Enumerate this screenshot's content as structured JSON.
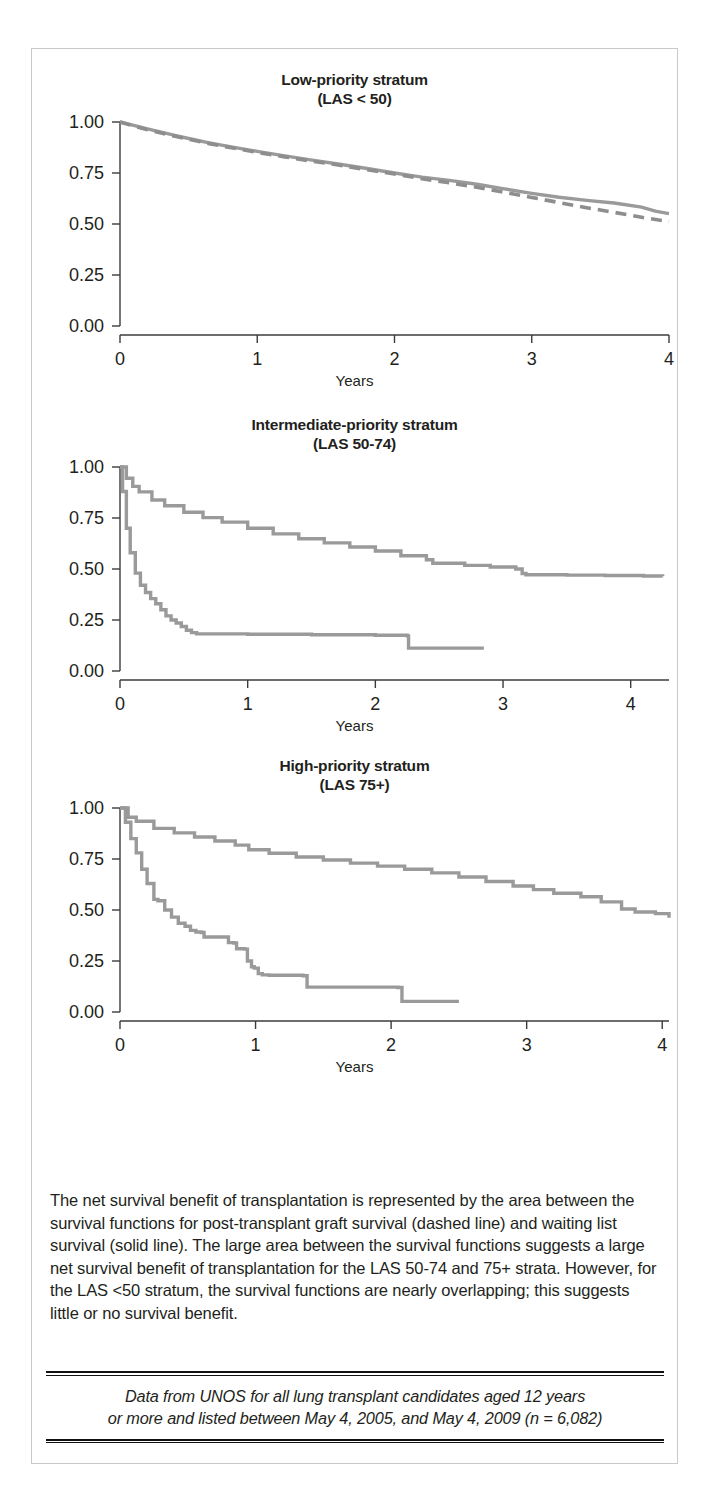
{
  "figure": {
    "border_color": "#c9c9c9",
    "background": "#ffffff"
  },
  "panels": [
    {
      "title": "Low-priority stratum",
      "subtitle": "(LAS < 50)",
      "xlabel": "Years"
    },
    {
      "title": "Intermediate-priority stratum",
      "subtitle": "(LAS 50-74)",
      "xlabel": "Years"
    },
    {
      "title": "High-priority stratum",
      "subtitle": "(LAS 75+)",
      "xlabel": "Years"
    }
  ],
  "caption": {
    "text": "The net survival benefit of transplantation is represented by the area between the survival functions for post-transplant graft survival (dashed line) and waiting list survival (solid line). The large area between the survival functions suggests a large net survival benefit of transplantation for the LAS 50-74 and 75+ strata. However, for the LAS <50 stratum, the survival functions are nearly overlapping; this suggests little or no survival benefit."
  },
  "source_note": {
    "line1": "Data from UNOS for all lung transplant candidates aged 12 years",
    "line2": "or more and listed between May 4, 2005, and May 4, 2009 (n = 6,082)"
  },
  "chart_data": [
    {
      "type": "line",
      "title": "Low-priority stratum",
      "subtitle": "(LAS < 50)",
      "xlabel": "Years",
      "ylabel": "",
      "xlim": [
        0,
        4.0
      ],
      "xticks": [
        0,
        1,
        2,
        3,
        4
      ],
      "xtick_labels": [
        "0",
        "1",
        "2",
        "3",
        "4"
      ],
      "ylim": [
        0,
        1.0
      ],
      "yticks": [
        0.0,
        0.25,
        0.5,
        0.75,
        1.0
      ],
      "ytick_labels": [
        "0.00",
        "0.25",
        "0.50",
        "0.75",
        "1.00"
      ],
      "grid": false,
      "legend": "none",
      "colors": {
        "solid": "#9a9a9a",
        "dashed": "#8e8e8e"
      },
      "series": [
        {
          "name": "Waiting list survival (solid line)",
          "style": "solid",
          "x": [
            0.0,
            0.1,
            0.2,
            0.3,
            0.4,
            0.5,
            0.65,
            0.8,
            1.0,
            1.2,
            1.4,
            1.6,
            1.8,
            2.0,
            2.2,
            2.4,
            2.6,
            2.8,
            3.0,
            3.2,
            3.4,
            3.6,
            3.8,
            3.9,
            4.0
          ],
          "y": [
            1.0,
            0.983,
            0.966,
            0.95,
            0.934,
            0.919,
            0.898,
            0.879,
            0.856,
            0.834,
            0.813,
            0.793,
            0.772,
            0.75,
            0.73,
            0.714,
            0.695,
            0.672,
            0.65,
            0.631,
            0.616,
            0.603,
            0.583,
            0.563,
            0.551
          ]
        },
        {
          "name": "Post-transplant graft survival (dashed line)",
          "style": "dashed",
          "x": [
            0.0,
            0.1,
            0.2,
            0.3,
            0.4,
            0.5,
            0.65,
            0.8,
            1.0,
            1.2,
            1.4,
            1.6,
            1.8,
            2.0,
            2.2,
            2.4,
            2.6,
            2.8,
            3.0,
            3.2,
            3.4,
            3.6,
            3.8,
            4.0
          ],
          "y": [
            1.0,
            0.98,
            0.962,
            0.946,
            0.93,
            0.915,
            0.894,
            0.875,
            0.851,
            0.829,
            0.808,
            0.788,
            0.766,
            0.745,
            0.722,
            0.702,
            0.68,
            0.655,
            0.63,
            0.605,
            0.58,
            0.557,
            0.533,
            0.512
          ]
        }
      ]
    },
    {
      "type": "line",
      "title": "Intermediate-priority stratum",
      "subtitle": "(LAS 50-74)",
      "xlabel": "Years",
      "ylabel": "",
      "xlim": [
        0,
        4.3
      ],
      "xticks": [
        0,
        1,
        2,
        3,
        4
      ],
      "xtick_labels": [
        "0",
        "1",
        "2",
        "3",
        "4"
      ],
      "ylim": [
        0,
        1.0
      ],
      "yticks": [
        0.0,
        0.25,
        0.5,
        0.75,
        1.0
      ],
      "ytick_labels": [
        "0.00",
        "0.25",
        "0.50",
        "0.75",
        "1.00"
      ],
      "grid": false,
      "legend": "none",
      "colors": {
        "solid": "#9a9a9a",
        "dashed": "#8e8e8e"
      },
      "series": [
        {
          "name": "Waiting list survival (solid line)",
          "style": "step",
          "x": [
            0.0,
            0.02,
            0.05,
            0.08,
            0.12,
            0.16,
            0.2,
            0.24,
            0.28,
            0.32,
            0.36,
            0.4,
            0.44,
            0.48,
            0.52,
            0.56,
            0.6,
            1.0,
            1.5,
            2.0,
            2.25,
            2.26,
            2.5,
            2.85
          ],
          "y": [
            1.0,
            0.88,
            0.7,
            0.58,
            0.48,
            0.42,
            0.385,
            0.355,
            0.33,
            0.3,
            0.27,
            0.25,
            0.235,
            0.218,
            0.2,
            0.188,
            0.182,
            0.18,
            0.178,
            0.175,
            0.172,
            0.112,
            0.112,
            0.112
          ]
        },
        {
          "name": "Post-transplant graft survival (dashed line)",
          "style": "step",
          "x": [
            0.0,
            0.05,
            0.1,
            0.15,
            0.25,
            0.35,
            0.5,
            0.65,
            0.8,
            1.0,
            1.2,
            1.4,
            1.6,
            1.8,
            2.0,
            2.2,
            2.4,
            2.45,
            2.7,
            2.9,
            3.1,
            3.15,
            3.18,
            3.5,
            3.8,
            4.1,
            4.25
          ],
          "y": [
            1.0,
            0.945,
            0.905,
            0.878,
            0.838,
            0.81,
            0.778,
            0.752,
            0.73,
            0.7,
            0.672,
            0.648,
            0.628,
            0.608,
            0.588,
            0.565,
            0.545,
            0.528,
            0.518,
            0.51,
            0.5,
            0.478,
            0.472,
            0.47,
            0.468,
            0.466,
            0.465
          ]
        }
      ]
    },
    {
      "type": "line",
      "title": "High-priority stratum",
      "subtitle": "(LAS 75+)",
      "xlabel": "Years",
      "ylabel": "",
      "xlim": [
        0,
        4.05
      ],
      "xticks": [
        0,
        1,
        2,
        3,
        4
      ],
      "xtick_labels": [
        "0",
        "1",
        "2",
        "3",
        "4"
      ],
      "ylim": [
        0,
        1.0
      ],
      "yticks": [
        0.0,
        0.25,
        0.5,
        0.75,
        1.0
      ],
      "ytick_labels": [
        "0.00",
        "0.25",
        "0.50",
        "0.75",
        "1.00"
      ],
      "grid": false,
      "legend": "none",
      "colors": {
        "solid": "#9a9a9a",
        "dashed": "#8e8e8e"
      },
      "series": [
        {
          "name": "Waiting list survival (solid line)",
          "style": "step",
          "x": [
            0.0,
            0.04,
            0.08,
            0.12,
            0.16,
            0.2,
            0.25,
            0.28,
            0.33,
            0.38,
            0.43,
            0.48,
            0.52,
            0.56,
            0.6,
            0.62,
            0.78,
            0.8,
            0.84,
            0.86,
            0.92,
            0.94,
            0.97,
            0.99,
            1.02,
            1.05,
            1.1,
            1.35,
            1.38,
            2.05,
            2.08,
            2.5
          ],
          "y": [
            1.0,
            0.93,
            0.85,
            0.78,
            0.7,
            0.63,
            0.552,
            0.545,
            0.5,
            0.465,
            0.435,
            0.42,
            0.4,
            0.392,
            0.39,
            0.368,
            0.368,
            0.34,
            0.338,
            0.31,
            0.308,
            0.25,
            0.222,
            0.215,
            0.188,
            0.182,
            0.18,
            0.178,
            0.122,
            0.12,
            0.052,
            0.052
          ]
        },
        {
          "name": "Post-transplant graft survival (dashed line)",
          "style": "step",
          "x": [
            0.0,
            0.06,
            0.12,
            0.25,
            0.4,
            0.55,
            0.7,
            0.85,
            0.95,
            1.1,
            1.3,
            1.5,
            1.7,
            1.9,
            2.1,
            2.3,
            2.5,
            2.7,
            2.9,
            3.05,
            3.2,
            3.4,
            3.55,
            3.7,
            3.8,
            3.95,
            4.05
          ],
          "y": [
            1.0,
            0.955,
            0.935,
            0.9,
            0.878,
            0.858,
            0.838,
            0.818,
            0.795,
            0.778,
            0.76,
            0.745,
            0.73,
            0.715,
            0.7,
            0.682,
            0.662,
            0.64,
            0.618,
            0.6,
            0.582,
            0.565,
            0.54,
            0.505,
            0.49,
            0.482,
            0.462
          ]
        }
      ]
    }
  ]
}
